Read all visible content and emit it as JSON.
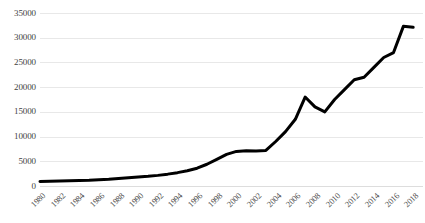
{
  "chart_data": {
    "type": "line",
    "title": "",
    "subtitle": "",
    "xlabel": "",
    "ylabel": "",
    "grid": "horizontal",
    "legend": "none",
    "xlim": [
      1980,
      2019
    ],
    "ylim": [
      0,
      35000
    ],
    "ytick_step": 5000,
    "ytick_labels": [
      "0",
      "5000",
      "10000",
      "15000",
      "20000",
      "25000",
      "30000",
      "35000"
    ],
    "ytick_values": [
      0,
      5000,
      10000,
      15000,
      20000,
      25000,
      30000,
      35000
    ],
    "xtick_labels": [
      "1980",
      "1982",
      "1984",
      "1986",
      "1988",
      "1990",
      "1992",
      "1994",
      "1996",
      "1998",
      "2000",
      "2002",
      "2004",
      "2006",
      "2008",
      "2010",
      "2012",
      "2014",
      "2016",
      "2018"
    ],
    "xtick_values": [
      1980,
      1982,
      1984,
      1986,
      1988,
      1990,
      1992,
      1994,
      1996,
      1998,
      2000,
      2002,
      2004,
      2006,
      2008,
      2010,
      2012,
      2014,
      2016,
      2018
    ],
    "x": [
      1980,
      1981,
      1982,
      1983,
      1984,
      1985,
      1986,
      1987,
      1988,
      1989,
      1990,
      1991,
      1992,
      1993,
      1994,
      1995,
      1996,
      1997,
      1998,
      1999,
      2000,
      2001,
      2002,
      2003,
      2004,
      2005,
      2006,
      2007,
      2008,
      2009,
      2010,
      2011,
      2012,
      2013,
      2014,
      2015,
      2016,
      2017,
      2018
    ],
    "values": [
      900,
      950,
      1000,
      1050,
      1100,
      1150,
      1250,
      1350,
      1500,
      1650,
      1800,
      1950,
      2150,
      2400,
      2700,
      3100,
      3600,
      4400,
      5400,
      6400,
      7000,
      7150,
      7100,
      7200,
      9000,
      11000,
      13500,
      18000,
      16000,
      15000,
      17500,
      19500,
      21500,
      22000,
      24000,
      26000,
      27000,
      32300,
      32100
    ],
    "series": [
      {
        "name": "series-1",
        "color": "#000000",
        "line_width": 3,
        "markers": false,
        "values": [
          900,
          950,
          1000,
          1050,
          1100,
          1150,
          1250,
          1350,
          1500,
          1650,
          1800,
          1950,
          2150,
          2400,
          2700,
          3100,
          3600,
          4400,
          5400,
          6400,
          7000,
          7150,
          7100,
          7200,
          9000,
          11000,
          13500,
          18000,
          16000,
          15000,
          17500,
          19500,
          21500,
          22000,
          24000,
          26000,
          27000,
          32300,
          32100
        ]
      }
    ],
    "colors": {
      "line": "#000000",
      "gridline": "#e8e8e8",
      "tick_text": "#3f3f3f",
      "background": "#ffffff"
    }
  }
}
